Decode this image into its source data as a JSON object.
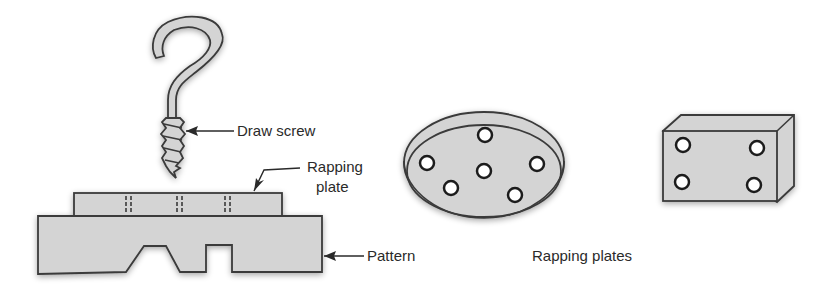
{
  "figure": {
    "labels": {
      "draw_screw": "Draw screw",
      "rapping_plate_line1": "Rapping",
      "rapping_plate_line2": "plate",
      "pattern": "Pattern",
      "rapping_plates": "Rapping plates"
    },
    "components": [
      {
        "name": "draw-screw",
        "shape": "hook with threaded shank"
      },
      {
        "name": "rapping-plate",
        "shape": "flat plate on pattern top with screw holes"
      },
      {
        "name": "pattern",
        "shape": "block with trapezoidal and rectangular recesses"
      },
      {
        "name": "circular-rapping-plate",
        "holes": 6
      },
      {
        "name": "rectangular-rapping-plate",
        "holes": 4
      }
    ],
    "colors": {
      "fill": "#d4d4d4",
      "stroke": "#3a3a3a",
      "text": "#2a2a2a",
      "background": "#ffffff"
    }
  }
}
